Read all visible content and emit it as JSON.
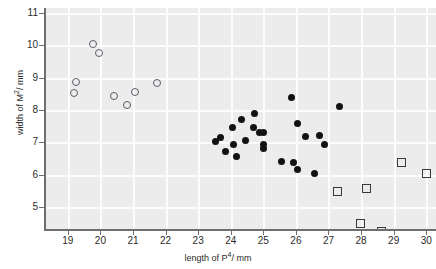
{
  "chart_data": {
    "type": "scatter",
    "title": "",
    "xlabel": "length of P4 / mm",
    "xlabel_base": "length of P",
    "xlabel_sup": "4",
    "xlabel_unit": "/ mm",
    "ylabel": "width of M2 / mm",
    "ylabel_base": "width of M",
    "ylabel_sup": "2",
    "ylabel_unit": "/ mm",
    "xlim": [
      18.3,
      30.3
    ],
    "ylim": [
      4.3,
      11.15
    ],
    "xticks": [
      19,
      20,
      21,
      22,
      23,
      24,
      25,
      26,
      27,
      28,
      29,
      30
    ],
    "yticks": [
      5,
      6,
      7,
      8,
      9,
      10,
      11
    ],
    "xtick_labels": [
      "19",
      "20",
      "21",
      "22",
      "23",
      "24",
      "25",
      "26",
      "27",
      "28",
      "29",
      "30"
    ],
    "ytick_labels": [
      "5",
      "6",
      "7",
      "8",
      "9",
      "10",
      "11"
    ],
    "grid": true,
    "grid_color": "#fcfcfc",
    "panel_color": "#ececec",
    "legend": "none",
    "series": [
      {
        "name": "open-circle-group",
        "marker": "open-circle",
        "color": "#5b5b66",
        "points": [
          {
            "x": 19.15,
            "y": 8.55
          },
          {
            "x": 19.23,
            "y": 8.9
          },
          {
            "x": 19.75,
            "y": 10.08
          },
          {
            "x": 19.93,
            "y": 9.8
          },
          {
            "x": 20.38,
            "y": 8.48
          },
          {
            "x": 20.78,
            "y": 8.18
          },
          {
            "x": 21.02,
            "y": 8.58
          },
          {
            "x": 21.7,
            "y": 8.88
          }
        ]
      },
      {
        "name": "filled-circle-group",
        "marker": "filled-circle",
        "color": "#121212",
        "points": [
          {
            "x": 23.53,
            "y": 7.02
          },
          {
            "x": 23.7,
            "y": 7.15
          },
          {
            "x": 23.85,
            "y": 6.72
          },
          {
            "x": 24.05,
            "y": 7.45
          },
          {
            "x": 24.1,
            "y": 6.95
          },
          {
            "x": 24.18,
            "y": 6.58
          },
          {
            "x": 24.32,
            "y": 7.72
          },
          {
            "x": 24.45,
            "y": 7.05
          },
          {
            "x": 24.7,
            "y": 7.45
          },
          {
            "x": 24.72,
            "y": 7.88
          },
          {
            "x": 24.88,
            "y": 7.3
          },
          {
            "x": 25.0,
            "y": 7.3
          },
          {
            "x": 25.02,
            "y": 6.95
          },
          {
            "x": 25.02,
            "y": 6.8
          },
          {
            "x": 25.55,
            "y": 6.42
          },
          {
            "x": 25.85,
            "y": 8.4
          },
          {
            "x": 25.92,
            "y": 6.38
          },
          {
            "x": 26.05,
            "y": 7.6
          },
          {
            "x": 26.3,
            "y": 7.2
          },
          {
            "x": 26.05,
            "y": 6.18
          },
          {
            "x": 26.58,
            "y": 6.05
          },
          {
            "x": 26.72,
            "y": 7.22
          },
          {
            "x": 26.88,
            "y": 6.95
          },
          {
            "x": 27.35,
            "y": 8.12
          }
        ]
      },
      {
        "name": "open-square-group",
        "marker": "open-square",
        "color": "#3a3a3a",
        "points": [
          {
            "x": 27.25,
            "y": 5.52
          },
          {
            "x": 28.15,
            "y": 5.62
          },
          {
            "x": 27.95,
            "y": 4.52
          },
          {
            "x": 28.6,
            "y": 4.3
          },
          {
            "x": 29.2,
            "y": 6.4
          },
          {
            "x": 29.98,
            "y": 6.08
          }
        ]
      }
    ]
  }
}
